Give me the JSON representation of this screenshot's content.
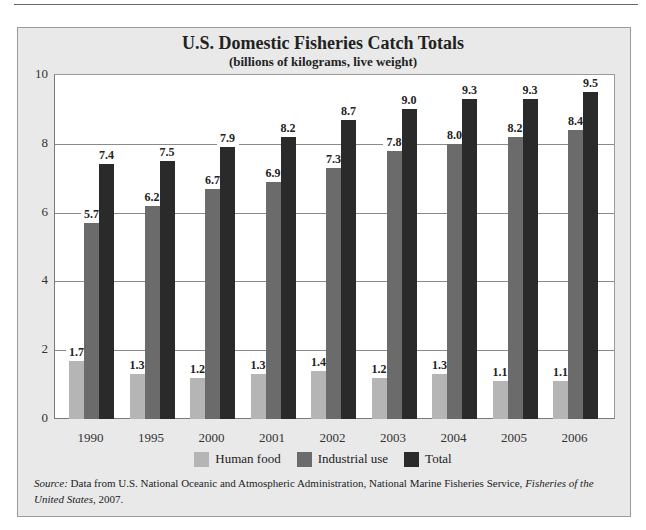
{
  "chart_data": {
    "type": "bar",
    "title": "U.S. Domestic Fisheries Catch Totals",
    "subtitle": "(billions of kilograms, live weight)",
    "xlabel": "",
    "ylabel": "",
    "ylim": [
      0,
      10
    ],
    "yticks": [
      0,
      2,
      4,
      6,
      8,
      10
    ],
    "grid": true,
    "legend_position": "bottom",
    "categories": [
      "1990",
      "1995",
      "2000",
      "2001",
      "2002",
      "2003",
      "2004",
      "2005",
      "2006"
    ],
    "series": [
      {
        "name": "Human food",
        "color": "#b5b5b5",
        "values": [
          1.7,
          1.3,
          1.2,
          1.3,
          1.4,
          1.2,
          1.3,
          1.1,
          1.1
        ]
      },
      {
        "name": "Industrial use",
        "color": "#6b6b6b",
        "values": [
          5.7,
          6.2,
          6.7,
          6.9,
          7.3,
          7.8,
          8.0,
          8.2,
          8.4
        ]
      },
      {
        "name": "Total",
        "color": "#2a2a2a",
        "values": [
          7.4,
          7.5,
          7.9,
          8.2,
          8.7,
          9.0,
          9.3,
          9.3,
          9.5
        ]
      }
    ]
  },
  "source": {
    "label": "Source:",
    "text": " Data from U.S. National Oceanic and Atmospheric Administration, National Marine Fisheries Service, ",
    "italic": "Fisheries of the United States",
    "end": ", 2007."
  }
}
